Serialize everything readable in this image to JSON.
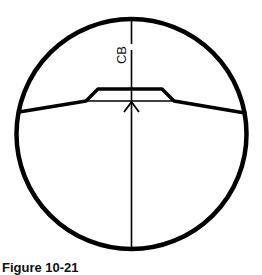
{
  "figure": {
    "caption": "Figure 10-21",
    "label": "CB",
    "colors": {
      "stroke": "#000000",
      "background": "#ffffff"
    }
  }
}
